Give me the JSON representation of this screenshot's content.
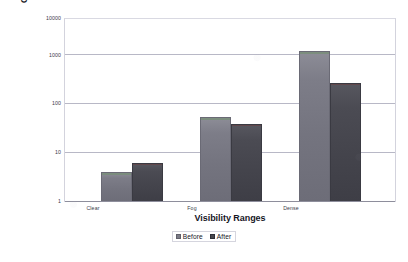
{
  "chart_data": {
    "type": "bar",
    "title": "",
    "xlabel": "Visibility Ranges",
    "ylabel_line1": "Collisions per million encounter",
    "ylabel_line2": "situations",
    "categories": [
      "Clear",
      "Fog",
      "Dense"
    ],
    "series": [
      {
        "name": "Before",
        "values": [
          4.3,
          70,
          2000
        ]
      },
      {
        "name": "After",
        "values": [
          7,
          50,
          400
        ]
      }
    ],
    "yscale": "log",
    "ylim": [
      1,
      10000
    ],
    "yticks": [
      "1",
      "10",
      "100",
      "1000",
      "10000"
    ],
    "grid": true,
    "legend_position": "bottom-center",
    "colors": {
      "before": "#7b7b86",
      "after": "#46464e",
      "gridline": "#b8b8c6",
      "plot_border": "#d3d3dd",
      "text": "#1b1b28"
    }
  }
}
